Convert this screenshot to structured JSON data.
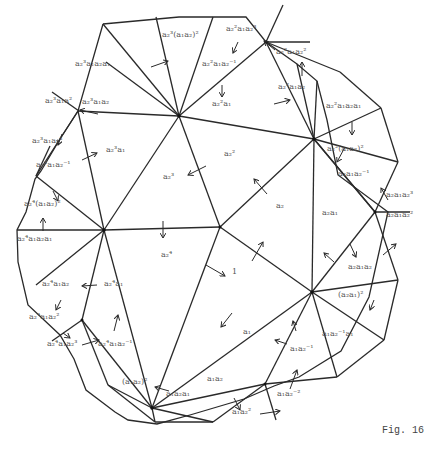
{
  "figure": {
    "caption": "Fig. 16",
    "stroke_color": "#2a2a2a",
    "label_color": "#555555"
  },
  "vertices": {
    "A": [
      179,
      116
    ],
    "B": [
      266,
      42
    ],
    "C": [
      104,
      230
    ],
    "D": [
      220,
      227
    ],
    "E": [
      312,
      292
    ],
    "F": [
      152,
      408
    ],
    "G": [
      375,
      212
    ],
    "H": [
      314,
      139
    ],
    "o1": [
      140,
      24
    ],
    "o2": [
      213,
      24
    ],
    "o3": [
      308,
      81
    ],
    "o4": [
      335,
      107
    ],
    "o5": [
      388,
      214
    ],
    "o6": [
      371,
      340
    ],
    "o7": [
      329,
      383
    ],
    "o8": [
      246,
      412
    ],
    "o9": [
      188,
      422
    ],
    "o10": [
      108,
      422
    ],
    "o11": [
      60,
      405
    ],
    "o12": [
      38,
      335
    ],
    "o13": [
      17,
      230
    ],
    "o14": [
      36,
      176
    ],
    "o15": [
      79,
      111
    ],
    "o16": [
      82,
      95
    ],
    "o17": [
      41,
      176
    ],
    "o18": [
      82,
      320
    ],
    "o19": [
      265,
      394
    ]
  },
  "labels": [
    {
      "id": "l1",
      "text": "1",
      "x": 232,
      "y": 273
    },
    {
      "id": "l2",
      "text": "a₂",
      "x": 276,
      "y": 207
    },
    {
      "id": "l3",
      "text": "a₂²",
      "x": 224,
      "y": 155
    },
    {
      "id": "l4",
      "text": "a₂³",
      "x": 163,
      "y": 178
    },
    {
      "id": "l5",
      "text": "a₂⁴",
      "x": 161,
      "y": 256
    },
    {
      "id": "l6",
      "text": "a₁",
      "x": 243,
      "y": 333
    },
    {
      "id": "l7",
      "text": "a₂a₁",
      "x": 322,
      "y": 214
    },
    {
      "id": "l8",
      "text": "a₂²a₁",
      "x": 212,
      "y": 105
    },
    {
      "id": "l9",
      "text": "a₂³a₁",
      "x": 106,
      "y": 151
    },
    {
      "id": "l10",
      "text": "a₂⁴a₁",
      "x": 104,
      "y": 285
    },
    {
      "id": "l11",
      "text": "a₁a₂",
      "x": 207,
      "y": 380
    },
    {
      "id": "l12",
      "text": "a₁a₂a₁",
      "x": 166,
      "y": 395
    },
    {
      "id": "l13",
      "text": "(a₁a₂)²",
      "x": 122,
      "y": 383
    },
    {
      "id": "l14",
      "text": "a₁a₂⁻¹",
      "x": 290,
      "y": 350
    },
    {
      "id": "l15",
      "text": "a₁a₂⁻¹a₁",
      "x": 322,
      "y": 335
    },
    {
      "id": "l16",
      "text": "(a₂a₁)²",
      "x": 338,
      "y": 296
    },
    {
      "id": "l17",
      "text": "a₂a₁a₂",
      "x": 348,
      "y": 268
    },
    {
      "id": "l18",
      "text": "a₂a₁a₂⁻¹",
      "x": 338,
      "y": 175
    },
    {
      "id": "l19",
      "text": "a₂²(a₁a₂)²",
      "x": 327,
      "y": 150
    },
    {
      "id": "l20",
      "text": "a₂²a₁a₂a₁",
      "x": 326,
      "y": 107
    },
    {
      "id": "l21",
      "text": "a₂²a₁a₂",
      "x": 278,
      "y": 88
    },
    {
      "id": "l22",
      "text": "a₂²a₁a₂⁻¹",
      "x": 202,
      "y": 65
    },
    {
      "id": "l23",
      "text": "a₂³(a₁a₂)²",
      "x": 162,
      "y": 36
    },
    {
      "id": "l24",
      "text": "a₂³a₁a₂a₁",
      "x": 75,
      "y": 65
    },
    {
      "id": "l25",
      "text": "a₂³a₁a₂",
      "x": 82,
      "y": 103
    },
    {
      "id": "l26",
      "text": "a₂³a₁a₂⁻¹",
      "x": 36,
      "y": 166
    },
    {
      "id": "l27",
      "text": "a₂⁴(a₁a₂)²",
      "x": 24,
      "y": 205
    },
    {
      "id": "l28",
      "text": "a₂⁴a₁a₂a₁",
      "x": 17,
      "y": 240
    },
    {
      "id": "l29",
      "text": "a₂⁴a₁a₂",
      "x": 42,
      "y": 285
    },
    {
      "id": "l30",
      "text": "a₂⁴a₁a₂⁻¹",
      "x": 98,
      "y": 345
    },
    {
      "id": "l31",
      "text": "a₂a₁a₂³",
      "x": 386,
      "y": 196
    },
    {
      "id": "l32",
      "text": "a₂a₁a₂²",
      "x": 386,
      "y": 216
    },
    {
      "id": "l33",
      "text": "a₁a₂⁻²",
      "x": 277,
      "y": 395
    },
    {
      "id": "l34",
      "text": "a₁a₂²",
      "x": 232,
      "y": 413
    },
    {
      "id": "l35",
      "text": "a₂⁴a₁a₂²",
      "x": 29,
      "y": 318
    },
    {
      "id": "l36",
      "text": "a₂⁴a₁a₂³",
      "x": 47,
      "y": 345
    },
    {
      "id": "l37",
      "text": "a₂³a₁a₂³",
      "x": 32,
      "y": 142
    },
    {
      "id": "l38",
      "text": "a₂³a₁a²",
      "x": 45,
      "y": 102
    },
    {
      "id": "l39",
      "text": "a₂²a₁a₂³",
      "x": 226,
      "y": 30
    },
    {
      "id": "l40",
      "text": "a₂²a₁a₂²",
      "x": 276,
      "y": 53
    },
    {
      "id": "l41",
      "text": "a₁a₂²",
      "x": 232,
      "y": 413
    }
  ]
}
